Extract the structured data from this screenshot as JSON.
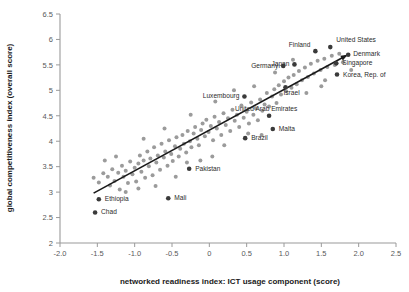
{
  "chart_data": {
    "type": "scatter",
    "title": "",
    "xlabel": "networked readiness index: ICT usage component (score)",
    "ylabel": "global competitiveness index (overall score)",
    "xlim": [
      -2.0,
      2.5
    ],
    "ylim": [
      2.0,
      6.5
    ],
    "xticks": [
      "-2.0",
      "-1.5",
      "-1.0",
      "-0.5",
      "0",
      "0.5",
      "1.0",
      "1.5",
      "2.0",
      "2.5"
    ],
    "xtick_values": [
      -2.0,
      -1.5,
      -1.0,
      -0.5,
      0,
      0.5,
      1.0,
      1.5,
      2.0,
      2.5
    ],
    "yticks": [
      "2",
      "2.5",
      "3",
      "3.5",
      "4",
      "4.5",
      "5",
      "5.5",
      "6",
      "6.5"
    ],
    "ytick_values": [
      2,
      2.5,
      3,
      3.5,
      4,
      4.5,
      5,
      5.5,
      6,
      6.5
    ],
    "grid": false,
    "legend": false,
    "trendline": {
      "type": "linear-fit-arrow",
      "x_start": -1.55,
      "y_start": 2.98,
      "x_end": 1.83,
      "y_end": 5.68,
      "color": "#1a1a1a"
    },
    "point_color_unlabeled": "#9b9b9b",
    "point_color_labeled": "#3a3a3a",
    "labeled_points": [
      {
        "label": "United States",
        "x": 1.62,
        "y": 5.85,
        "label_dx": 6,
        "label_dy": -5.5,
        "anchor": "start"
      },
      {
        "label": "Denmark",
        "x": 1.86,
        "y": 5.7,
        "label_dx": 5,
        "label_dy": 1.5,
        "anchor": "start"
      },
      {
        "label": "Singapore",
        "x": 1.7,
        "y": 5.53,
        "label_dx": 6,
        "label_dy": 2.0,
        "anchor": "start"
      },
      {
        "label": "Korea, Rep. of",
        "x": 1.71,
        "y": 5.31,
        "label_dx": 6,
        "label_dy": 2.0,
        "anchor": "start"
      },
      {
        "label": "Finland",
        "x": 1.42,
        "y": 5.77,
        "label_dx": -5,
        "label_dy": -4.5,
        "anchor": "end"
      },
      {
        "label": "Japan",
        "x": 1.14,
        "y": 5.51,
        "label_dx": -5,
        "label_dy": 1.5,
        "anchor": "end"
      },
      {
        "label": "Germany",
        "x": 0.99,
        "y": 5.48,
        "label_dx": -5,
        "label_dy": 2.0,
        "anchor": "end"
      },
      {
        "label": "Israel",
        "x": 1.02,
        "y": 5.06,
        "label_dx": -2,
        "label_dy": 7.5,
        "anchor": "start"
      },
      {
        "label": "Luxembourg",
        "x": 0.47,
        "y": 4.88,
        "label_dx": -5,
        "label_dy": 1.5,
        "anchor": "end"
      },
      {
        "label": "United Arab Emirates",
        "x": 0.8,
        "y": 4.5,
        "label_dx": -3,
        "label_dy": -5.0,
        "anchor": "middle"
      },
      {
        "label": "Malta",
        "x": 0.85,
        "y": 4.24,
        "label_dx": 6,
        "label_dy": 2.0,
        "anchor": "start"
      },
      {
        "label": "Brazil",
        "x": 0.48,
        "y": 4.06,
        "label_dx": 6,
        "label_dy": 2.0,
        "anchor": "start"
      },
      {
        "label": "Pakistan",
        "x": -0.27,
        "y": 3.46,
        "label_dx": 6,
        "label_dy": 2.0,
        "anchor": "start"
      },
      {
        "label": "Mali",
        "x": -0.55,
        "y": 2.88,
        "label_dx": 6,
        "label_dy": 2.0,
        "anchor": "start"
      },
      {
        "label": "Ethiopia",
        "x": -1.48,
        "y": 2.86,
        "label_dx": 6,
        "label_dy": 2.0,
        "anchor": "start"
      },
      {
        "label": "Chad",
        "x": -1.53,
        "y": 2.6,
        "label_dx": 6,
        "label_dy": 2.0,
        "anchor": "start"
      }
    ],
    "unlabeled_points": [
      {
        "x": -1.55,
        "y": 3.28
      },
      {
        "x": -1.48,
        "y": 3.19
      },
      {
        "x": -1.42,
        "y": 3.37
      },
      {
        "x": -1.36,
        "y": 3.3
      },
      {
        "x": -1.33,
        "y": 3.13
      },
      {
        "x": -1.3,
        "y": 3.45
      },
      {
        "x": -1.27,
        "y": 3.22
      },
      {
        "x": -1.22,
        "y": 3.38
      },
      {
        "x": -1.2,
        "y": 3.05
      },
      {
        "x": -1.17,
        "y": 3.52
      },
      {
        "x": -1.15,
        "y": 3.3
      },
      {
        "x": -1.12,
        "y": 3.42
      },
      {
        "x": -1.09,
        "y": 3.18
      },
      {
        "x": -1.06,
        "y": 3.6
      },
      {
        "x": -1.03,
        "y": 3.35
      },
      {
        "x": -1.0,
        "y": 3.48
      },
      {
        "x": -0.98,
        "y": 3.21
      },
      {
        "x": -0.95,
        "y": 3.56
      },
      {
        "x": -0.93,
        "y": 3.72
      },
      {
        "x": -0.91,
        "y": 3.4
      },
      {
        "x": -0.88,
        "y": 3.62
      },
      {
        "x": -0.86,
        "y": 3.28
      },
      {
        "x": -0.83,
        "y": 3.8
      },
      {
        "x": -0.81,
        "y": 3.51
      },
      {
        "x": -0.79,
        "y": 3.66
      },
      {
        "x": -0.76,
        "y": 3.33
      },
      {
        "x": -0.74,
        "y": 3.88
      },
      {
        "x": -0.71,
        "y": 3.58
      },
      {
        "x": -0.69,
        "y": 3.72
      },
      {
        "x": -0.66,
        "y": 3.44
      },
      {
        "x": -0.64,
        "y": 3.95
      },
      {
        "x": -0.61,
        "y": 3.68
      },
      {
        "x": -0.59,
        "y": 3.8
      },
      {
        "x": -0.56,
        "y": 3.52
      },
      {
        "x": -0.54,
        "y": 4.02
      },
      {
        "x": -0.51,
        "y": 3.75
      },
      {
        "x": -0.49,
        "y": 3.61
      },
      {
        "x": -0.46,
        "y": 3.9
      },
      {
        "x": -0.44,
        "y": 4.08
      },
      {
        "x": -0.41,
        "y": 3.7
      },
      {
        "x": -0.39,
        "y": 3.85
      },
      {
        "x": -0.36,
        "y": 4.12
      },
      {
        "x": -0.34,
        "y": 3.95
      },
      {
        "x": -0.31,
        "y": 3.78
      },
      {
        "x": -0.29,
        "y": 4.2
      },
      {
        "x": -0.26,
        "y": 4.0
      },
      {
        "x": -0.24,
        "y": 3.88
      },
      {
        "x": -0.21,
        "y": 4.15
      },
      {
        "x": -0.19,
        "y": 4.28
      },
      {
        "x": -0.16,
        "y": 4.05
      },
      {
        "x": -0.14,
        "y": 3.92
      },
      {
        "x": -0.11,
        "y": 4.22
      },
      {
        "x": -0.09,
        "y": 4.35
      },
      {
        "x": -0.06,
        "y": 4.1
      },
      {
        "x": -0.04,
        "y": 4.42
      },
      {
        "x": -0.01,
        "y": 4.18
      },
      {
        "x": 0.02,
        "y": 4.3
      },
      {
        "x": 0.05,
        "y": 4.02
      },
      {
        "x": 0.07,
        "y": 4.48
      },
      {
        "x": 0.1,
        "y": 4.25
      },
      {
        "x": 0.13,
        "y": 4.38
      },
      {
        "x": 0.16,
        "y": 4.12
      },
      {
        "x": 0.19,
        "y": 4.55
      },
      {
        "x": 0.22,
        "y": 4.32
      },
      {
        "x": 0.25,
        "y": 4.45
      },
      {
        "x": 0.28,
        "y": 4.2
      },
      {
        "x": 0.31,
        "y": 4.62
      },
      {
        "x": 0.34,
        "y": 4.4
      },
      {
        "x": 0.37,
        "y": 4.52
      },
      {
        "x": 0.4,
        "y": 4.28
      },
      {
        "x": 0.43,
        "y": 4.7
      },
      {
        "x": 0.46,
        "y": 4.46
      },
      {
        "x": 0.5,
        "y": 4.58
      },
      {
        "x": 0.53,
        "y": 4.35
      },
      {
        "x": 0.56,
        "y": 4.76
      },
      {
        "x": 0.59,
        "y": 4.52
      },
      {
        "x": 0.62,
        "y": 4.65
      },
      {
        "x": 0.65,
        "y": 4.41
      },
      {
        "x": 0.68,
        "y": 4.82
      },
      {
        "x": 0.71,
        "y": 4.6
      },
      {
        "x": 0.74,
        "y": 4.72
      },
      {
        "x": 0.77,
        "y": 4.95
      },
      {
        "x": 0.8,
        "y": 4.68
      },
      {
        "x": 0.84,
        "y": 4.88
      },
      {
        "x": 0.87,
        "y": 5.02
      },
      {
        "x": 0.9,
        "y": 4.75
      },
      {
        "x": 0.93,
        "y": 5.1
      },
      {
        "x": 0.96,
        "y": 4.92
      },
      {
        "x": 1.0,
        "y": 5.18
      },
      {
        "x": 1.03,
        "y": 4.98
      },
      {
        "x": 1.06,
        "y": 5.25
      },
      {
        "x": 1.1,
        "y": 5.05
      },
      {
        "x": 1.13,
        "y": 5.3
      },
      {
        "x": 1.17,
        "y": 5.12
      },
      {
        "x": 1.2,
        "y": 5.38
      },
      {
        "x": 1.24,
        "y": 5.2
      },
      {
        "x": 1.28,
        "y": 5.45
      },
      {
        "x": 1.32,
        "y": 5.26
      },
      {
        "x": 1.36,
        "y": 5.52
      },
      {
        "x": 1.4,
        "y": 5.33
      },
      {
        "x": 1.45,
        "y": 5.58
      },
      {
        "x": 1.49,
        "y": 5.4
      },
      {
        "x": 1.54,
        "y": 5.62
      },
      {
        "x": 1.58,
        "y": 5.46
      },
      {
        "x": 1.64,
        "y": 5.68
      },
      {
        "x": 1.68,
        "y": 5.5
      },
      {
        "x": 1.74,
        "y": 5.72
      },
      {
        "x": 1.79,
        "y": 5.55
      },
      {
        "x": -1.12,
        "y": 3.0
      },
      {
        "x": -0.95,
        "y": 3.07
      },
      {
        "x": -0.72,
        "y": 3.12
      },
      {
        "x": -0.45,
        "y": 3.3
      },
      {
        "x": -0.3,
        "y": 3.58
      },
      {
        "x": -0.12,
        "y": 3.62
      },
      {
        "x": 0.04,
        "y": 3.7
      },
      {
        "x": 0.2,
        "y": 3.92
      },
      {
        "x": -0.88,
        "y": 4.05
      },
      {
        "x": -0.6,
        "y": 4.25
      },
      {
        "x": -0.25,
        "y": 4.52
      },
      {
        "x": 0.08,
        "y": 4.78
      },
      {
        "x": 0.33,
        "y": 5.0
      },
      {
        "x": 0.6,
        "y": 5.08
      },
      {
        "x": 0.88,
        "y": 5.35
      },
      {
        "x": 1.12,
        "y": 5.6
      },
      {
        "x": -1.4,
        "y": 3.62
      },
      {
        "x": -1.25,
        "y": 3.7
      },
      {
        "x": 0.7,
        "y": 4.12
      },
      {
        "x": 0.52,
        "y": 4.15
      },
      {
        "x": 1.3,
        "y": 4.95
      },
      {
        "x": 1.5,
        "y": 5.08
      },
      {
        "x": 1.55,
        "y": 5.2
      },
      {
        "x": 1.9,
        "y": 5.4
      }
    ]
  }
}
